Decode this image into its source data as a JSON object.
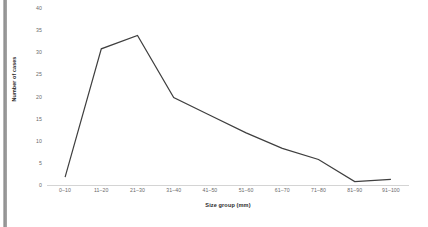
{
  "chart_data": {
    "type": "line",
    "title": "",
    "xlabel": "Size group (mm)",
    "ylabel": "Number of cases",
    "categories": [
      "0–10",
      "11–20",
      "21–30",
      "31–40",
      "41–50",
      "51–60",
      "61–70",
      "71–80",
      "81–90",
      "91–100"
    ],
    "values": [
      2,
      31,
      34,
      20,
      16,
      12,
      8.5,
      6,
      1,
      1.5
    ],
    "series": [
      {
        "name": "Number of cases",
        "values": [
          2,
          31,
          34,
          20,
          16,
          12,
          8.5,
          6,
          1,
          1.5
        ],
        "color": "#3f3f3f"
      }
    ],
    "ylim": [
      0,
      40
    ],
    "ytick_values": [
      0,
      5,
      10,
      15,
      20,
      25,
      30,
      35,
      40
    ],
    "ytick_labels": [
      "0",
      "5",
      "10",
      "15",
      "20",
      "25",
      "30",
      "35",
      "40"
    ],
    "grid": false,
    "legend": false,
    "legend_position": "none",
    "markers": false,
    "line_color": "#3f3f3f",
    "axis_line_color": "#d4d4d4",
    "tick_label_color": "#6a6a6a",
    "axis_title_color": "#2b2b2b",
    "background_color": "#ffffff"
  }
}
